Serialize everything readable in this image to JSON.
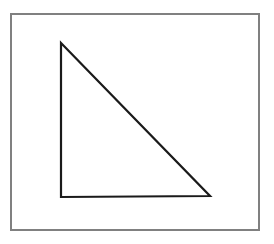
{
  "canvas": {
    "width": 274,
    "height": 244,
    "background_color": "#ffffff"
  },
  "figure": {
    "frame": {
      "name": "outer-border-rectangle",
      "x": 11,
      "y": 14,
      "width": 248,
      "height": 216,
      "stroke_color": "#808080",
      "stroke_width": 1.2,
      "fill": "none"
    },
    "shape": {
      "name": "right-triangle",
      "type": "polygon",
      "vertices": [
        {
          "label": "apex",
          "x": 61,
          "y": 43
        },
        {
          "label": "bottom-right",
          "x": 210,
          "y": 196
        },
        {
          "label": "bottom-left",
          "x": 61,
          "y": 197
        }
      ],
      "points": "61,43 210,196 61,197",
      "stroke_color": "#1a1a1a",
      "stroke_width": 2.2,
      "fill": "none",
      "right_angle_at": "bottom-left",
      "leg_vertical_length": 154,
      "leg_horizontal_length": 149
    }
  }
}
